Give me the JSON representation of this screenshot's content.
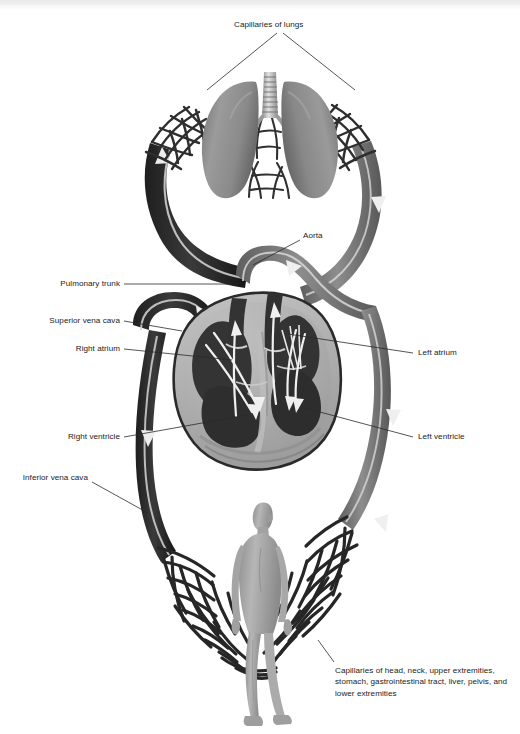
{
  "figure": {
    "type": "anatomical-illustration",
    "background_color": "#ffffff",
    "ink_color": "#1b1b1b"
  },
  "labels": {
    "capillaries_of_lungs": "Capillaries of lungs",
    "aorta": "Aorta",
    "pulmonary_trunk": "Pulmonary trunk",
    "superior_vena_cava": "Superior vena cava",
    "right_atrium": "Right atrium",
    "right_ventricle": "Right ventricle",
    "inferior_vena_cava": "Inferior vena cava",
    "left_atrium": "Left atrium",
    "left_ventricle": "Left ventricle",
    "systemic_capillaries": "Capillaries of head, neck, upper extremities, stomach, gastrointestinal tract, liver, pelvis, and lower extremities"
  },
  "structures": {
    "lungs": "lungs",
    "trachea": "trachea",
    "heart": "heart-cross-section",
    "human_figure": "human-body-figure",
    "pulmonary_capillary_bed_left": "pulmonary-capillary-network-left",
    "pulmonary_capillary_bed_right": "pulmonary-capillary-network-right",
    "systemic_capillary_bed": "systemic-capillary-network"
  },
  "colors": {
    "deoxygenated_vessel": "#2b2b2b",
    "oxygenated_vessel": "#7d7d7d",
    "lung_tissue": "#8f8f8f",
    "myocardium": "#b5b5b5",
    "chamber": "#3c3c3c",
    "flow_arrow": "#f2f2f2",
    "body_figure": "#a9a9a9"
  }
}
